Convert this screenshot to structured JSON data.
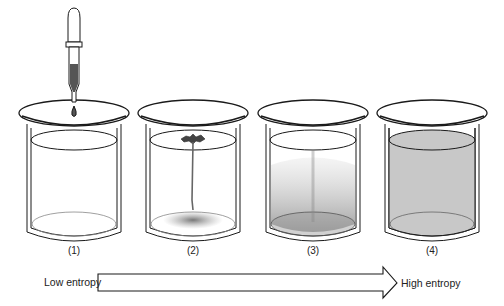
{
  "diagram": {
    "stages": [
      {
        "label": "(1)",
        "state": "dropper releasing a drop above clear water"
      },
      {
        "label": "(2)",
        "state": "dye spreading at surface and trailing to bottom"
      },
      {
        "label": "(3)",
        "state": "dye dispersing throughout the water"
      },
      {
        "label": "(4)",
        "state": "dye uniformly distributed (gray)"
      }
    ],
    "arrow": {
      "left_label": "Low entropy",
      "right_label": "High entropy"
    },
    "colors": {
      "line": "#1a1a1a",
      "uniform_fill": "#c8c8c8",
      "background": "#ffffff"
    }
  }
}
